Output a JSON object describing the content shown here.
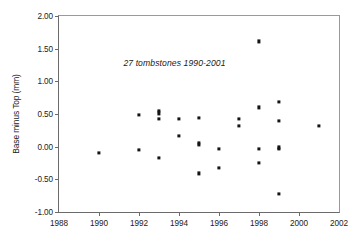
{
  "chart_data": {
    "type": "scatter",
    "title": "",
    "annotation": "27 tombstones 1990-2001",
    "xlabel": "",
    "ylabel": "Base minus Top (mm)",
    "xlim": [
      1988,
      2002
    ],
    "ylim": [
      -1.0,
      2.0
    ],
    "grid": false,
    "legend": false,
    "xticks": [
      1988,
      1990,
      1992,
      1994,
      1996,
      1998,
      2000,
      2002
    ],
    "xtick_labels": [
      "1988",
      "1990",
      "1992",
      "1994",
      "1996",
      "1998",
      "2000",
      "2002"
    ],
    "yticks": [
      -1.0,
      -0.5,
      0.0,
      0.5,
      1.0,
      1.5,
      2.0
    ],
    "ytick_labels": [
      "-1.00",
      "-0.50",
      "0.00",
      "0.50",
      "1.00",
      "1.50",
      "2.00"
    ],
    "marker_color": "#141414",
    "n_points": 27,
    "points": [
      {
        "x": 1990,
        "y": -0.1
      },
      {
        "x": 1992,
        "y": 0.48
      },
      {
        "x": 1992,
        "y": -0.05
      },
      {
        "x": 1993,
        "y": 0.55
      },
      {
        "x": 1993,
        "y": 0.51
      },
      {
        "x": 1993,
        "y": 0.42
      },
      {
        "x": 1993,
        "y": -0.17
      },
      {
        "x": 1994,
        "y": 0.42
      },
      {
        "x": 1994,
        "y": 0.16
      },
      {
        "x": 1995,
        "y": 0.44
      },
      {
        "x": 1995,
        "y": 0.06
      },
      {
        "x": 1995,
        "y": 0.03
      },
      {
        "x": 1995,
        "y": -0.41
      },
      {
        "x": 1996,
        "y": -0.03
      },
      {
        "x": 1996,
        "y": -0.32
      },
      {
        "x": 1997,
        "y": 0.42
      },
      {
        "x": 1997,
        "y": 0.32
      },
      {
        "x": 1998,
        "y": 1.61
      },
      {
        "x": 1998,
        "y": 0.6
      },
      {
        "x": 1998,
        "y": -0.04
      },
      {
        "x": 1998,
        "y": -0.25
      },
      {
        "x": 1999,
        "y": 0.68
      },
      {
        "x": 1999,
        "y": 0.4
      },
      {
        "x": 1999,
        "y": -0.01
      },
      {
        "x": 1999,
        "y": -0.04
      },
      {
        "x": 1999,
        "y": -0.72
      },
      {
        "x": 2001,
        "y": 0.32
      }
    ]
  }
}
